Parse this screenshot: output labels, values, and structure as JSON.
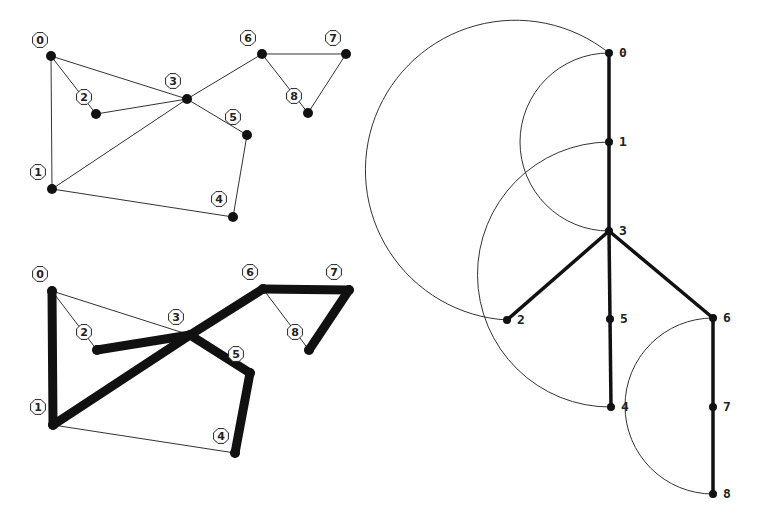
{
  "panels": {
    "graph": {
      "title": "",
      "nodes": [
        {
          "id": "0",
          "x": 51,
          "y": 56,
          "lx": 40,
          "ly": 40
        },
        {
          "id": "1",
          "x": 52,
          "y": 189,
          "lx": 38,
          "ly": 172
        },
        {
          "id": "2",
          "x": 96,
          "y": 114,
          "lx": 84,
          "ly": 97
        },
        {
          "id": "3",
          "x": 187,
          "y": 99,
          "lx": 173,
          "ly": 81
        },
        {
          "id": "4",
          "x": 233,
          "y": 217,
          "lx": 219,
          "ly": 199
        },
        {
          "id": "5",
          "x": 247,
          "y": 135,
          "lx": 233,
          "ly": 117
        },
        {
          "id": "6",
          "x": 262,
          "y": 54,
          "lx": 248,
          "ly": 38
        },
        {
          "id": "7",
          "x": 346,
          "y": 54,
          "lx": 333,
          "ly": 38
        },
        {
          "id": "8",
          "x": 308,
          "y": 113,
          "lx": 294,
          "ly": 96
        }
      ],
      "edges": [
        [
          "0",
          "1"
        ],
        [
          "0",
          "2"
        ],
        [
          "0",
          "3"
        ],
        [
          "2",
          "3"
        ],
        [
          "1",
          "3"
        ],
        [
          "3",
          "5"
        ],
        [
          "5",
          "4"
        ],
        [
          "1",
          "4"
        ],
        [
          "3",
          "6"
        ],
        [
          "6",
          "7"
        ],
        [
          "6",
          "8"
        ],
        [
          "7",
          "8"
        ]
      ]
    },
    "dfs_highlight": {
      "nodes": [
        {
          "id": "0",
          "x": 52,
          "y": 291,
          "lx": 40,
          "ly": 274
        },
        {
          "id": "1",
          "x": 53,
          "y": 425,
          "lx": 38,
          "ly": 407
        },
        {
          "id": "2",
          "x": 97,
          "y": 350,
          "lx": 84,
          "ly": 332
        },
        {
          "id": "3",
          "x": 190,
          "y": 335,
          "lx": 176,
          "ly": 317
        },
        {
          "id": "4",
          "x": 235,
          "y": 453,
          "lx": 221,
          "ly": 436
        },
        {
          "id": "5",
          "x": 250,
          "y": 373,
          "lx": 236,
          "ly": 354
        },
        {
          "id": "6",
          "x": 263,
          "y": 289,
          "lx": 250,
          "ly": 272
        },
        {
          "id": "7",
          "x": 349,
          "y": 290,
          "lx": 334,
          "ly": 272
        },
        {
          "id": "8",
          "x": 309,
          "y": 350,
          "lx": 295,
          "ly": 332
        }
      ],
      "tree_edges": [
        [
          "0",
          "1"
        ],
        [
          "1",
          "3"
        ],
        [
          "3",
          "2"
        ],
        [
          "3",
          "5"
        ],
        [
          "5",
          "4"
        ],
        [
          "3",
          "6"
        ],
        [
          "6",
          "7"
        ],
        [
          "7",
          "8"
        ]
      ],
      "back_edges": [
        [
          "0",
          "2"
        ],
        [
          "0",
          "3"
        ],
        [
          "1",
          "4"
        ],
        [
          "6",
          "8"
        ]
      ]
    },
    "dfs_tree": {
      "nodes": [
        {
          "id": "0",
          "x": 609,
          "y": 53
        },
        {
          "id": "1",
          "x": 609,
          "y": 142
        },
        {
          "id": "3",
          "x": 609,
          "y": 231
        },
        {
          "id": "2",
          "x": 507,
          "y": 320
        },
        {
          "id": "5",
          "x": 610,
          "y": 319
        },
        {
          "id": "4",
          "x": 611,
          "y": 407
        },
        {
          "id": "6",
          "x": 713,
          "y": 318
        },
        {
          "id": "7",
          "x": 713,
          "y": 407
        },
        {
          "id": "8",
          "x": 713,
          "y": 494
        }
      ],
      "tree_edges": [
        [
          "0",
          "1"
        ],
        [
          "1",
          "3"
        ],
        [
          "3",
          "2"
        ],
        [
          "3",
          "5"
        ],
        [
          "5",
          "4"
        ],
        [
          "3",
          "6"
        ],
        [
          "6",
          "7"
        ],
        [
          "7",
          "8"
        ]
      ],
      "back_edges": [
        [
          "0",
          "3"
        ],
        [
          "0",
          "2"
        ],
        [
          "1",
          "4"
        ],
        [
          "6",
          "8"
        ]
      ]
    }
  },
  "colors": {
    "edge": "#111111",
    "thin_edge": "#333333",
    "node": "#111111",
    "background": "#ffffff"
  }
}
